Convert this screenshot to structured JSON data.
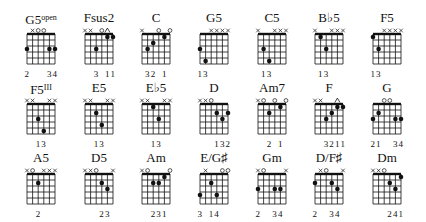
{
  "diagram": {
    "type": "guitar-chord-chart",
    "rows": 3,
    "columns": 7,
    "chords": [
      {
        "name": "G5",
        "sup": "open",
        "row": 0,
        "col": 0,
        "top": [
          "",
          "x",
          "o",
          "o",
          "",
          ""
        ],
        "dots": [
          [
            1,
            3
          ],
          [
            5,
            3
          ],
          [
            6,
            3
          ]
        ],
        "fingers": [
          "2",
          "",
          "",
          "",
          "3",
          "4"
        ]
      },
      {
        "name": "Fsus2",
        "sup": "",
        "row": 0,
        "col": 1,
        "top": [
          "x",
          "x",
          "",
          "o",
          "^",
          ""
        ],
        "dots": [
          [
            3,
            3
          ],
          [
            5,
            1
          ],
          [
            6,
            1
          ]
        ],
        "fingers": [
          "",
          "",
          "3",
          "",
          "1",
          "1"
        ]
      },
      {
        "name": "C",
        "sup": "",
        "row": 0,
        "col": 2,
        "top": [
          "x",
          "",
          "",
          "o",
          "",
          "o"
        ],
        "dots": [
          [
            2,
            3
          ],
          [
            3,
            2
          ],
          [
            5,
            1
          ]
        ],
        "fingers": [
          "",
          "3",
          "2",
          "",
          "1",
          ""
        ]
      },
      {
        "name": "G5",
        "sup": "",
        "row": 0,
        "col": 3,
        "top": [
          "",
          "",
          "x",
          "x",
          "x",
          "x"
        ],
        "dots": [
          [
            1,
            3
          ],
          [
            2,
            5
          ]
        ],
        "fingers": [
          "1",
          "3",
          "",
          "",
          "",
          ""
        ]
      },
      {
        "name": "C5",
        "sup": "",
        "row": 0,
        "col": 4,
        "top": [
          "x",
          "",
          "",
          "x",
          "x",
          "x"
        ],
        "dots": [
          [
            2,
            3
          ],
          [
            3,
            5
          ]
        ],
        "fingers": [
          "",
          "1",
          "3",
          "",
          "",
          ""
        ]
      },
      {
        "name": "B♭5",
        "sup": "",
        "row": 0,
        "col": 5,
        "top": [
          "x",
          "",
          "",
          "x",
          "x",
          "x"
        ],
        "dots": [
          [
            2,
            1
          ],
          [
            3,
            3
          ]
        ],
        "fingers": [
          "",
          "1",
          "3",
          "",
          "",
          ""
        ]
      },
      {
        "name": "F5",
        "sup": "",
        "row": 0,
        "col": 6,
        "top": [
          "",
          "",
          "x",
          "x",
          "x",
          "x"
        ],
        "dots": [
          [
            1,
            1
          ],
          [
            2,
            3
          ]
        ],
        "fingers": [
          "1",
          "3",
          "",
          "",
          "",
          ""
        ]
      },
      {
        "name": "F5",
        "sup": "III",
        "row": 1,
        "col": 0,
        "top": [
          "x",
          "x",
          "",
          "",
          "x",
          "x"
        ],
        "dots": [
          [
            3,
            3
          ],
          [
            4,
            5
          ]
        ],
        "fingers": [
          "",
          "",
          "1",
          "3",
          "",
          ""
        ]
      },
      {
        "name": "E5",
        "sup": "",
        "row": 1,
        "col": 1,
        "top": [
          "x",
          "x",
          "",
          "",
          "x",
          "x"
        ],
        "dots": [
          [
            3,
            2
          ],
          [
            4,
            4
          ]
        ],
        "fingers": [
          "",
          "",
          "1",
          "3",
          "",
          ""
        ]
      },
      {
        "name": "E♭5",
        "sup": "",
        "row": 1,
        "col": 2,
        "top": [
          "x",
          "x",
          "",
          "",
          "x",
          "x"
        ],
        "dots": [
          [
            3,
            1
          ],
          [
            4,
            3
          ]
        ],
        "fingers": [
          "",
          "",
          "1",
          "3",
          "",
          ""
        ]
      },
      {
        "name": "D",
        "sup": "",
        "row": 1,
        "col": 3,
        "top": [
          "x",
          "x",
          "o",
          "",
          "",
          ""
        ],
        "dots": [
          [
            4,
            2
          ],
          [
            5,
            3
          ],
          [
            6,
            2
          ]
        ],
        "fingers": [
          "",
          "",
          "",
          "1",
          "3",
          "2"
        ]
      },
      {
        "name": "Am7",
        "sup": "",
        "row": 1,
        "col": 4,
        "top": [
          "x",
          "o",
          "",
          "o",
          "",
          "o"
        ],
        "dots": [
          [
            3,
            2
          ],
          [
            5,
            1
          ]
        ],
        "fingers": [
          "",
          "",
          "2",
          "",
          "1",
          ""
        ]
      },
      {
        "name": "F",
        "sup": "",
        "row": 1,
        "col": 5,
        "top": [
          "x",
          "x",
          "",
          "",
          "^",
          ""
        ],
        "dots": [
          [
            3,
            3
          ],
          [
            4,
            2
          ],
          [
            5,
            1
          ],
          [
            6,
            1
          ]
        ],
        "fingers": [
          "",
          "",
          "3",
          "2",
          "1",
          "1"
        ]
      },
      {
        "name": "G",
        "sup": "",
        "row": 1,
        "col": 6,
        "top": [
          "",
          "",
          "o",
          "o",
          "",
          ""
        ],
        "dots": [
          [
            1,
            3
          ],
          [
            2,
            2
          ],
          [
            5,
            3
          ],
          [
            6,
            3
          ]
        ],
        "fingers": [
          "2",
          "1",
          "",
          "",
          "3",
          "4"
        ]
      },
      {
        "name": "A5",
        "sup": "",
        "row": 2,
        "col": 0,
        "top": [
          "x",
          "o",
          "",
          "x",
          "x",
          "x"
        ],
        "dots": [
          [
            3,
            2
          ]
        ],
        "fingers": [
          "",
          "",
          "2",
          "",
          "",
          ""
        ]
      },
      {
        "name": "D5",
        "sup": "",
        "row": 2,
        "col": 1,
        "top": [
          "x",
          "x",
          "o",
          "",
          "",
          "x"
        ],
        "dots": [
          [
            4,
            2
          ],
          [
            5,
            3
          ]
        ],
        "fingers": [
          "",
          "",
          "",
          "2",
          "3",
          ""
        ]
      },
      {
        "name": "Am",
        "sup": "",
        "row": 2,
        "col": 2,
        "top": [
          "x",
          "o",
          "",
          "",
          "",
          "o"
        ],
        "dots": [
          [
            3,
            2
          ],
          [
            4,
            2
          ],
          [
            5,
            1
          ]
        ],
        "fingers": [
          "",
          "",
          "2",
          "3",
          "1",
          ""
        ]
      },
      {
        "name": "E/G♯",
        "sup": "",
        "row": 2,
        "col": 3,
        "top": [
          "",
          "x",
          "",
          "",
          "o",
          "o"
        ],
        "dots": [
          [
            1,
            4
          ],
          [
            3,
            2
          ],
          [
            4,
            4
          ]
        ],
        "fingers": [
          "3",
          "",
          "1",
          "4",
          "",
          ""
        ]
      },
      {
        "name": "Gm",
        "sup": "",
        "row": 2,
        "col": 4,
        "top": [
          "x",
          "o",
          "",
          "",
          "",
          "x"
        ],
        "dots": [
          [
            1,
            3
          ],
          [
            4,
            3
          ],
          [
            5,
            3
          ]
        ],
        "fingers": [
          "2",
          "",
          "",
          "3",
          "4",
          ""
        ]
      },
      {
        "name": "D/F♯",
        "sup": "",
        "row": 2,
        "col": 5,
        "top": [
          "",
          "x",
          "o",
          "",
          "",
          "x"
        ],
        "dots": [
          [
            1,
            2
          ],
          [
            4,
            2
          ],
          [
            5,
            3
          ]
        ],
        "fingers": [
          "2",
          "",
          "",
          "3",
          "4",
          ""
        ]
      },
      {
        "name": "Dm",
        "sup": "",
        "row": 2,
        "col": 6,
        "top": [
          "x",
          "x",
          "o",
          "",
          "",
          ""
        ],
        "dots": [
          [
            4,
            2
          ],
          [
            5,
            3
          ],
          [
            6,
            1
          ]
        ],
        "fingers": [
          "",
          "",
          "",
          "2",
          "4",
          "1"
        ]
      }
    ]
  },
  "colors": {
    "ink": "#111111",
    "background": "#ffffff",
    "grid": "#222222"
  }
}
